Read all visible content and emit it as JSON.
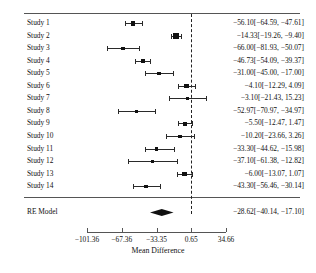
{
  "chart_data": {
    "type": "forest",
    "title": "",
    "xlabel": "Mean Difference",
    "ylabel": "",
    "xlim": [
      -118.36,
      51.66
    ],
    "xticks": [
      -101.36,
      -67.36,
      -33.35,
      0.65,
      34.66
    ],
    "xtick_labels": [
      "−101.36",
      "−67.36",
      "−33.35",
      "0.65",
      "34.66"
    ],
    "reference_line": 0.65,
    "grid": false,
    "legend": null,
    "columns": {
      "study": "",
      "estimate_ci": ""
    },
    "studies": [
      {
        "label": "Study 1",
        "estimate": -56.1,
        "ci_low": -64.59,
        "ci_high": -47.61,
        "weight": 0.5,
        "text": "−56.10[−64.59, −47.61]"
      },
      {
        "label": "Study 2",
        "estimate": -14.33,
        "ci_low": -19.26,
        "ci_high": -9.4,
        "weight": 1.0,
        "text": "−14.33[−19.26, −9.40]"
      },
      {
        "label": "Study 3",
        "estimate": -66.0,
        "ci_low": -81.93,
        "ci_high": -50.07,
        "weight": 0.26,
        "text": "−66.00[−81.93, −50.07]"
      },
      {
        "label": "Study 4",
        "estimate": -46.73,
        "ci_low": -54.09,
        "ci_high": -39.37,
        "weight": 0.6,
        "text": "−46.73[−54.09, −39.37]"
      },
      {
        "label": "Study 5",
        "estimate": -31.0,
        "ci_low": -45.0,
        "ci_high": -17.0,
        "weight": 0.3,
        "text": "−31.00[−45.00, −17.00]"
      },
      {
        "label": "Study 6",
        "estimate": -4.1,
        "ci_low": -12.29,
        "ci_high": 4.09,
        "weight": 0.52,
        "text": "−4.10[−12.29, 4.09]"
      },
      {
        "label": "Study 7",
        "estimate": -3.1,
        "ci_low": -21.43,
        "ci_high": 15.23,
        "weight": 0.23,
        "text": "−3.10[−21.43, 15.23]"
      },
      {
        "label": "Study 8",
        "estimate": -52.97,
        "ci_low": -70.97,
        "ci_high": -34.97,
        "weight": 0.24,
        "text": "−52.97[−70.97, −34.97]"
      },
      {
        "label": "Study 9",
        "estimate": -5.5,
        "ci_low": -12.47,
        "ci_high": 1.47,
        "weight": 0.62,
        "text": "−5.50[−12.47, 1.47]"
      },
      {
        "label": "Study 10",
        "estimate": -10.2,
        "ci_low": -23.66,
        "ci_high": 3.26,
        "weight": 0.32,
        "text": "−10.20[−23.66, 3.26]"
      },
      {
        "label": "Study 11",
        "estimate": -33.3,
        "ci_low": -44.62,
        "ci_high": -15.98,
        "weight": 0.35,
        "text": "−33.30[−44.62, −15.98]"
      },
      {
        "label": "Study 12",
        "estimate": -37.1,
        "ci_low": -61.38,
        "ci_high": -12.82,
        "weight": 0.18,
        "text": "−37.10[−61.38, −12.82]"
      },
      {
        "label": "Study 13",
        "estimate": -6.0,
        "ci_low": -13.07,
        "ci_high": 1.07,
        "weight": 0.61,
        "text": "−6.00[−13.07, 1.07]"
      },
      {
        "label": "Study 14",
        "estimate": -43.3,
        "ci_low": -56.46,
        "ci_high": -30.14,
        "weight": 0.33,
        "text": "−43.30[−56.46, −30.14]"
      }
    ],
    "summary": {
      "label": "RE Model",
      "estimate": -28.62,
      "ci_low": -40.14,
      "ci_high": -17.1,
      "text": "−28.62[−40.14, −17.10]"
    }
  }
}
